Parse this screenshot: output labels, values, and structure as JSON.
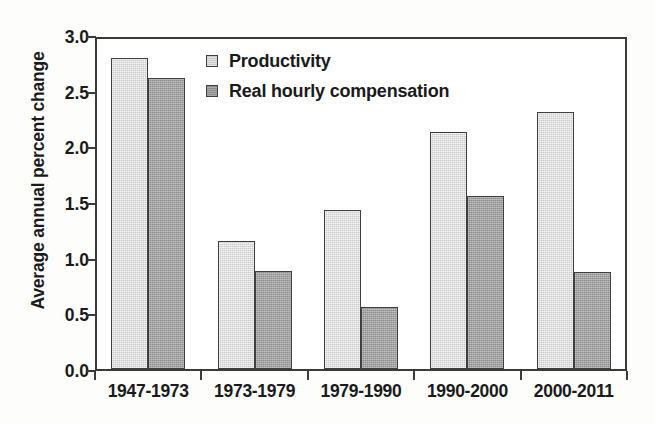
{
  "chart_data": {
    "type": "bar",
    "title": "",
    "xlabel": "",
    "ylabel": "Average annual percent change",
    "categories": [
      "1947-1973",
      "1973-1979",
      "1979-1990",
      "1990-2000",
      "2000-2011"
    ],
    "series": [
      {
        "name": "Productivity",
        "color": "#c9c9c9",
        "values": [
          2.79,
          1.15,
          1.43,
          2.13,
          2.31
        ]
      },
      {
        "name": "Real hourly compensation",
        "color": "#8b8b8b",
        "values": [
          2.61,
          0.88,
          0.56,
          1.55,
          0.87
        ]
      }
    ],
    "ylim": [
      0.0,
      3.0
    ],
    "yticks": [
      "0.0",
      "0.5",
      "1.0",
      "1.5",
      "2.0",
      "2.5",
      "3.0"
    ],
    "ytick_values": [
      0.0,
      0.5,
      1.0,
      1.5,
      2.0,
      2.5,
      3.0
    ],
    "grid": false,
    "legend_position": "top-left-inside",
    "frame": true,
    "axis_color": "#3a3a3a",
    "background_color": "#ffffff"
  }
}
